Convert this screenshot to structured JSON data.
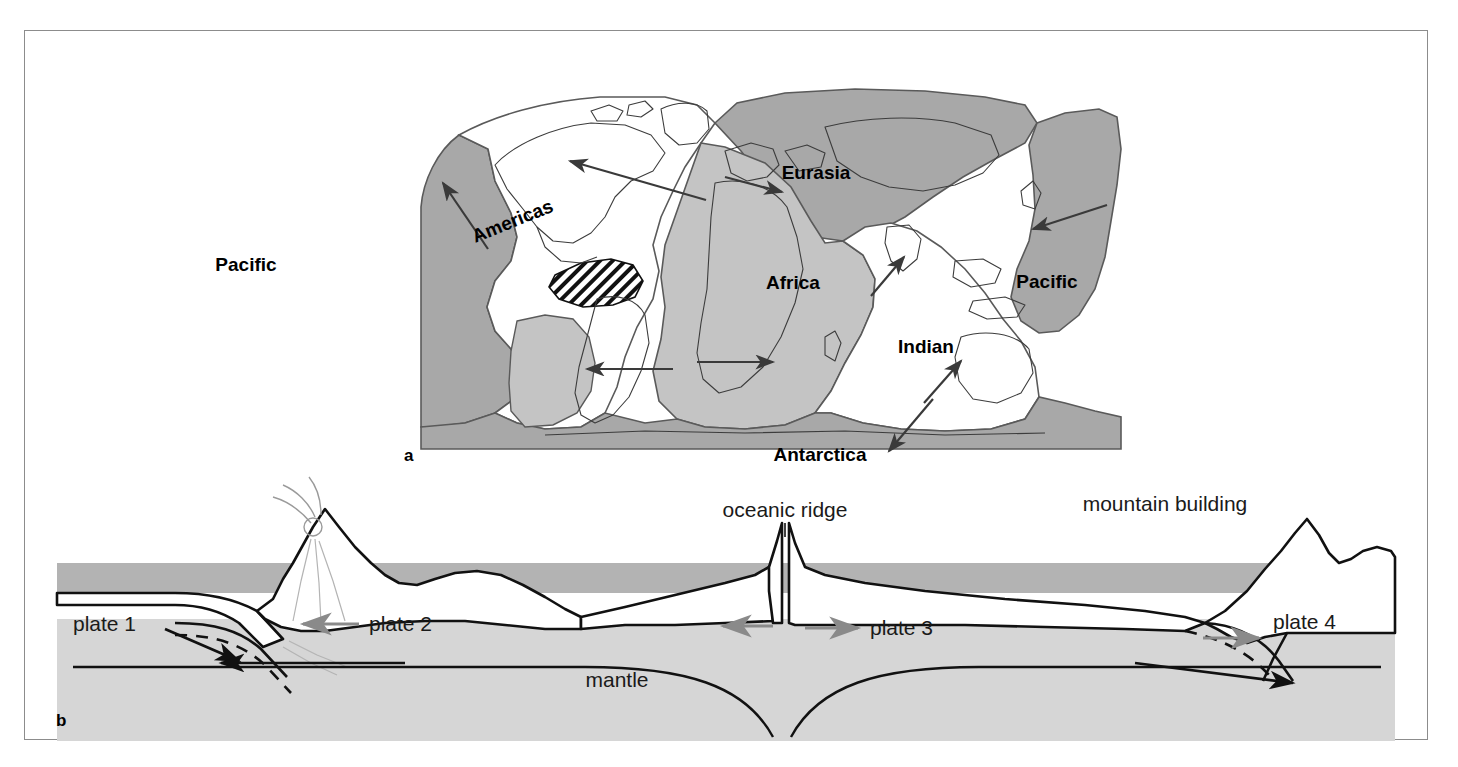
{
  "figure": {
    "panels": [
      {
        "letter": "a",
        "type": "world-map",
        "description": "World map showing major lithospheric plates and their relative motion directions"
      },
      {
        "letter": "b",
        "type": "cross-section",
        "description": "Cross-section through the lithosphere and mantle showing subduction, sea-floor spreading and mountain building"
      }
    ]
  },
  "map": {
    "plate_labels": [
      {
        "name": "Pacific",
        "x": 221,
        "y": 240
      },
      {
        "name": "Americas",
        "x": 490,
        "y": 196
      },
      {
        "name": "Eurasia",
        "x": 791,
        "y": 148
      },
      {
        "name": "Africa",
        "x": 768,
        "y": 258
      },
      {
        "name": "Pacific",
        "x": 1022,
        "y": 257
      },
      {
        "name": "Indian",
        "x": 901,
        "y": 322
      },
      {
        "name": "Antarctica",
        "x": 795,
        "y": 430
      }
    ],
    "motion_arrows": [
      {
        "name": "pacific-northwest-arrow",
        "x1": 463,
        "y1": 218,
        "x2": 415,
        "y2": 148
      },
      {
        "name": "atlantic-americas-arrow",
        "x1": 681,
        "y1": 169,
        "x2": 540,
        "y2": 128
      },
      {
        "name": "eurasia-west-arrow",
        "x1": 705,
        "y1": 150,
        "x2": 760,
        "y2": 163
      },
      {
        "name": "pacific-west-arrow",
        "x1": 1080,
        "y1": 176,
        "x2": 1006,
        "y2": 198
      },
      {
        "name": "indian-north-arrow",
        "x1": 846,
        "y1": 263,
        "x2": 880,
        "y2": 225
      },
      {
        "name": "australia-north-arrow",
        "x1": 899,
        "y1": 371,
        "x2": 937,
        "y2": 330
      },
      {
        "name": "antarctica-southeast-arrow",
        "x1": 905,
        "y1": 370,
        "x2": 862,
        "y2": 420
      },
      {
        "name": "south-atlantic-west-arrow",
        "x1": 645,
        "y1": 338,
        "x2": 560,
        "y2": 338
      },
      {
        "name": "africa-east-arrow",
        "x1": 672,
        "y1": 331,
        "x2": 745,
        "y2": 331
      }
    ]
  },
  "cross_section": {
    "labels": {
      "plate1": "plate 1",
      "plate2": "plate 2",
      "plate3": "plate 3",
      "plate4": "plate 4",
      "oceanic_ridge": "oceanic ridge",
      "mountain_building": "mountain building",
      "mantle": "mantle"
    },
    "label_positions": {
      "plate1": {
        "x": 76,
        "y": 600
      },
      "plate2": {
        "x": 339,
        "y": 595
      },
      "plate3": {
        "x": 844,
        "y": 600
      },
      "plate4": {
        "x": 1293,
        "y": 594
      },
      "oceanic_ridge": {
        "x": 715,
        "y": 511
      },
      "mountain_building": {
        "x": 1087,
        "y": 504
      },
      "mantle": {
        "x": 590,
        "y": 648
      }
    },
    "plate_motion_arrows": [
      {
        "name": "plate2-left-arrow",
        "direction": "left",
        "x1": 330,
        "y1": 593,
        "x2": 275,
        "y2": 593
      },
      {
        "name": "plate3-left-arrow",
        "direction": "left",
        "x1": 745,
        "y1": 595,
        "x2": 696,
        "y2": 595
      },
      {
        "name": "plate3-right-arrow",
        "direction": "right",
        "x1": 778,
        "y1": 597,
        "x2": 831,
        "y2": 597
      },
      {
        "name": "plate4-right-arrow",
        "direction": "right",
        "x1": 1177,
        "y1": 607,
        "x2": 1233,
        "y2": 607
      }
    ],
    "mantle_flow_arrows": [
      {
        "name": "mantle-flow-left-arrow",
        "direction": "left"
      },
      {
        "name": "mantle-flow-right-arrow",
        "direction": "right"
      }
    ]
  },
  "colors": {
    "plate_dark": "#a8a8a8",
    "plate_mid": "#c4c4c4",
    "plate_light": "#dcdcdc",
    "ocean_layer": "#b3b3b3",
    "mantle_layer": "#d6d6d6",
    "outline": "#000000",
    "frame": "#8c8c8c",
    "arrow_gray": "#8a8a8a",
    "arrow_black": "#111111",
    "white": "#ffffff"
  }
}
